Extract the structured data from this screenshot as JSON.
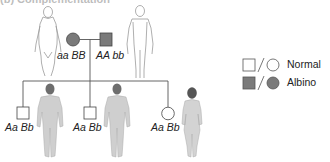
{
  "figure": {
    "title_fragment": "(b) Complementation",
    "parents": [
      {
        "sex": "female",
        "phenotype": "albino",
        "genotype": "aa BB"
      },
      {
        "sex": "male",
        "phenotype": "albino",
        "genotype": "AA bb"
      }
    ],
    "children": [
      {
        "sex": "male",
        "phenotype": "normal",
        "genotype": "Aa Bb"
      },
      {
        "sex": "male",
        "phenotype": "normal",
        "genotype": "Aa Bb"
      },
      {
        "sex": "female",
        "phenotype": "normal",
        "genotype": "Aa Bb"
      }
    ],
    "legend": [
      {
        "symbols": "open square / open circle",
        "label": "Normal"
      },
      {
        "symbols": "filled square / filled circle",
        "label": "Albino"
      }
    ],
    "colors": {
      "affected_fill": "#7a7a7a",
      "line": "#555555",
      "figure_outline": "#9a9a9a",
      "figure_fill_child": "#cfcfcf"
    }
  }
}
